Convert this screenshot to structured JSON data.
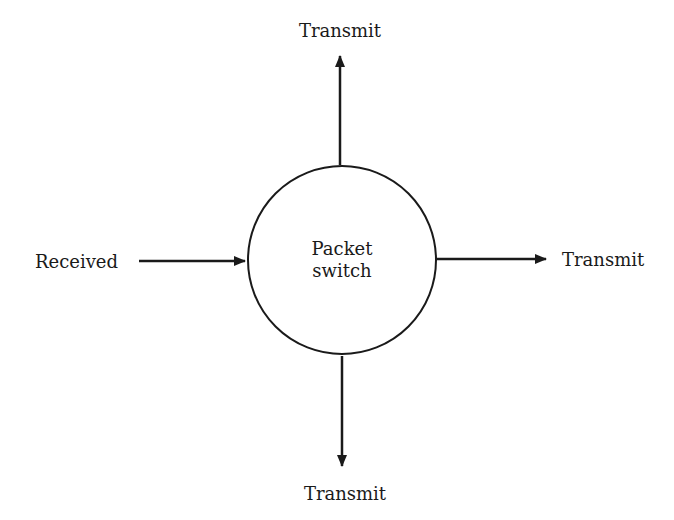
{
  "diagram": {
    "node": {
      "line1": "Packet",
      "line2": "switch"
    },
    "labels": {
      "input": "Received",
      "top": "Transmit",
      "right": "Transmit",
      "bottom": "Transmit"
    },
    "edges": [
      {
        "from": "Received",
        "to": "Packet switch",
        "direction": "in"
      },
      {
        "from": "Packet switch",
        "to": "Transmit (top)",
        "direction": "out"
      },
      {
        "from": "Packet switch",
        "to": "Transmit (right)",
        "direction": "out"
      },
      {
        "from": "Packet switch",
        "to": "Transmit (bottom)",
        "direction": "out"
      }
    ],
    "colors": {
      "stroke": "#1a1a1a",
      "background": "#ffffff"
    }
  }
}
